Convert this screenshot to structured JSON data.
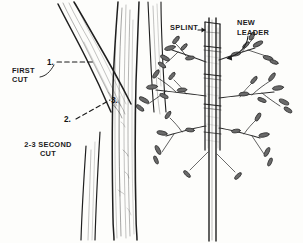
{
  "figure": {
    "kind": "line-illustration",
    "panels": [
      "branch-pruning-cuts",
      "conifer-splint-new-leader"
    ],
    "background_color": "#fdfdfb",
    "ink_color": "#1b1b1b"
  },
  "left_panel": {
    "name": "branch-pruning-cuts",
    "labels": {
      "first_cut": "FIRST\nCUT",
      "second_cut": "2-3 SECOND\nCUT"
    },
    "callout_numbers": {
      "one": "1.",
      "two": "2.",
      "three": "3."
    }
  },
  "right_panel": {
    "name": "conifer-splint-new-leader",
    "labels": {
      "splint": "SPLINT",
      "new_leader": "NEW\nLEADER"
    }
  }
}
